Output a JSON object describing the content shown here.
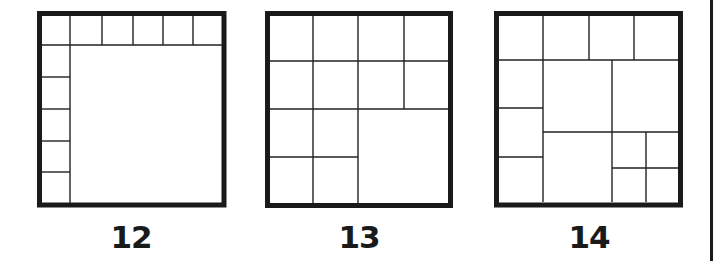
{
  "colors": {
    "line": "#222222",
    "outer_border": "#1a1a1a",
    "background": "#ffffff"
  },
  "stroke": {
    "outer": 5,
    "inner": 1.4,
    "page_edge": 3
  },
  "page_edge": {
    "x": 711.5,
    "y1": 0,
    "y2": 261
  },
  "figures": [
    {
      "label": "12",
      "label_x": 131,
      "outer": {
        "x": 39.5,
        "y": 13.5,
        "w": 184.5,
        "h": 191.5
      },
      "description": "Square divided into one large square plus 11 small squares along top row and left column",
      "piece_count": 12,
      "lines": [
        [
          41,
          45,
          222,
          45
        ],
        [
          70,
          15,
          70,
          203
        ],
        [
          102,
          15,
          102,
          45
        ],
        [
          133,
          15,
          133,
          45
        ],
        [
          163,
          15,
          163,
          45
        ],
        [
          193,
          15,
          193,
          45
        ],
        [
          41,
          77,
          70,
          77
        ],
        [
          41,
          109,
          70,
          109
        ],
        [
          41,
          141,
          70,
          141
        ],
        [
          41,
          172,
          70,
          172
        ]
      ]
    },
    {
      "label": "13",
      "label_x": 359,
      "outer": {
        "x": 267.5,
        "y": 13.5,
        "w": 183,
        "h": 192
      },
      "description": "Square divided into 12 small squares and one large square in lower-right quadrant",
      "piece_count": 13,
      "lines": [
        [
          269,
          61,
          448,
          61
        ],
        [
          269,
          109,
          448,
          109
        ],
        [
          269,
          157,
          358,
          157
        ],
        [
          313,
          15,
          313,
          203
        ],
        [
          358,
          15,
          358,
          203
        ],
        [
          404,
          15,
          404,
          109
        ]
      ]
    },
    {
      "label": "14",
      "label_x": 589,
      "outer": {
        "x": 496.5,
        "y": 13.5,
        "w": 184,
        "h": 191.5
      },
      "description": "Square divided into 14 squares of varying sizes: top row of 4, left column of 3, three medium squares and four small squares",
      "piece_count": 14,
      "lines": [
        [
          498,
          60,
          678,
          60
        ],
        [
          543,
          15,
          543,
          202
        ],
        [
          589,
          15,
          589,
          60
        ],
        [
          634,
          15,
          634,
          60
        ],
        [
          498,
          108,
          543,
          108
        ],
        [
          498,
          157,
          543,
          157
        ],
        [
          612,
          60,
          612,
          202
        ],
        [
          543,
          132,
          678,
          132
        ],
        [
          646,
          132,
          646,
          202
        ],
        [
          612,
          168,
          678,
          168
        ]
      ]
    }
  ]
}
